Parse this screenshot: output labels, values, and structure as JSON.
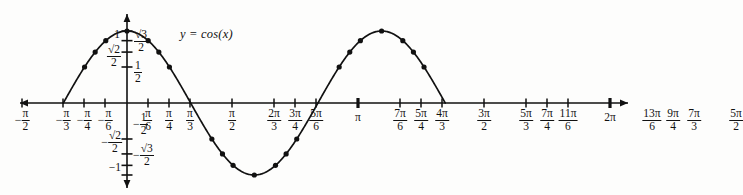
{
  "figure": {
    "function_label": "y = cos(x)",
    "background": "#fdfdfc",
    "ink": "#111111"
  },
  "chart_data": {
    "type": "line",
    "title": "y = cos(x)",
    "xlabel": "",
    "ylabel": "",
    "xlim": [
      -1.5707963,
      7.8539816
    ],
    "ylim": [
      -1.15,
      1.15
    ],
    "grid": false,
    "legend": "inline-label",
    "x_unit": "pi",
    "x_tick_labels": [
      "-π/2",
      "-π/3",
      "-π/4",
      "-π/6",
      "π/6",
      "π/4",
      "π/3",
      "π/2",
      "2π/3",
      "3π/4",
      "5π/6",
      "π",
      "7π/6",
      "5π/4",
      "4π/3",
      "3π/2",
      "5π/3",
      "7π/4",
      "11π/6",
      "2π",
      "13π/6",
      "9π/4",
      "7π/3",
      "5π/2"
    ],
    "y_tick_labels": [
      "1",
      "√3/2",
      "√2/2",
      "1/2",
      "-1/2",
      "-√2/2",
      "-√3/2",
      "-1"
    ],
    "y_tick_values": [
      1,
      0.8660254,
      0.7071068,
      0.5,
      -0.5,
      -0.7071068,
      -0.8660254,
      -1
    ],
    "series": [
      {
        "name": "cos(x)",
        "marker": "filled-circle",
        "x": [
          -1.5707963,
          -1.0471976,
          -0.7853982,
          -0.5235988,
          0,
          0.5235988,
          0.7853982,
          1.0471976,
          1.5707963,
          2.0943951,
          2.3561945,
          2.6179939,
          3.1415927,
          3.6651914,
          3.9269908,
          4.1887902,
          4.712389,
          5.2359878,
          5.4977871,
          5.7595865,
          6.2831853,
          6.8067841,
          7.0685835,
          7.3303829,
          7.8539816
        ],
        "y": [
          0,
          0.5,
          0.7071068,
          0.8660254,
          1,
          0.8660254,
          0.7071068,
          0.5,
          0,
          -0.5,
          -0.7071068,
          -0.8660254,
          -1,
          -0.8660254,
          -0.7071068,
          -0.5,
          0,
          0.5,
          0.7071068,
          0.8660254,
          1,
          0.8660254,
          0.7071068,
          0.5,
          0
        ]
      }
    ]
  },
  "x_ticks": [
    {
      "id": "neg-pi-over-2",
      "num": "π",
      "den": "2",
      "sign": "-",
      "x": 22
    },
    {
      "id": "neg-pi-over-3",
      "num": "π",
      "den": "3",
      "sign": "-",
      "x": 63
    },
    {
      "id": "neg-pi-over-4",
      "num": "π",
      "den": "4",
      "sign": "-",
      "x": 84
    },
    {
      "id": "neg-pi-over-6",
      "num": "π",
      "den": "6",
      "sign": "-",
      "x": 105
    },
    {
      "id": "pi-over-6",
      "num": "π",
      "den": "6",
      "sign": "",
      "x": 148
    },
    {
      "id": "pi-over-4",
      "num": "π",
      "den": "4",
      "sign": "",
      "x": 169
    },
    {
      "id": "pi-over-3",
      "num": "π",
      "den": "3",
      "sign": "",
      "x": 190
    },
    {
      "id": "pi-over-2",
      "num": "π",
      "den": "2",
      "sign": "",
      "x": 232
    },
    {
      "id": "two-pi-over-3",
      "num": "2π",
      "den": "3",
      "sign": "",
      "x": 274
    },
    {
      "id": "three-pi-over-4",
      "num": "3π",
      "den": "4",
      "sign": "",
      "x": 295
    },
    {
      "id": "five-pi-over-6",
      "num": "5π",
      "den": "6",
      "sign": "",
      "x": 316
    },
    {
      "id": "pi",
      "num": "π",
      "den": "",
      "sign": "",
      "x": 358
    },
    {
      "id": "seven-pi-over-6",
      "num": "7π",
      "den": "6",
      "sign": "",
      "x": 400
    },
    {
      "id": "five-pi-over-4",
      "num": "5π",
      "den": "4",
      "sign": "",
      "x": 421
    },
    {
      "id": "four-pi-over-3",
      "num": "4π",
      "den": "3",
      "sign": "",
      "x": 442
    },
    {
      "id": "three-pi-over-2",
      "num": "3π",
      "den": "2",
      "sign": "",
      "x": 484
    },
    {
      "id": "five-pi-over-3",
      "num": "5π",
      "den": "3",
      "sign": "",
      "x": 526
    },
    {
      "id": "seven-pi-over-4",
      "num": "7π",
      "den": "4",
      "sign": "",
      "x": 547
    },
    {
      "id": "eleven-pi-over-6",
      "num": "11π",
      "den": "6",
      "sign": "",
      "x": 568
    },
    {
      "id": "two-pi",
      "num": "2π",
      "den": "",
      "sign": "",
      "x": 610
    },
    {
      "id": "thirteen-pi-over-6",
      "num": "13π",
      "den": "6",
      "sign": "",
      "x": 652
    },
    {
      "id": "nine-pi-over-4",
      "num": "9π",
      "den": "4",
      "sign": "",
      "x": 673
    },
    {
      "id": "seven-pi-over-3",
      "num": "7π",
      "den": "3",
      "sign": "",
      "x": 694
    },
    {
      "id": "five-pi-over-2",
      "num": "5π",
      "den": "2",
      "sign": "",
      "x": 736
    }
  ],
  "y_labels": {
    "one": "1",
    "sqrt3_num": "√3",
    "sqrt3_den": "2",
    "sqrt2_num": "√2",
    "sqrt2_den": "2",
    "half_num": "1",
    "half_den": "2",
    "neg_sign": "−",
    "neg_one": "−1"
  }
}
